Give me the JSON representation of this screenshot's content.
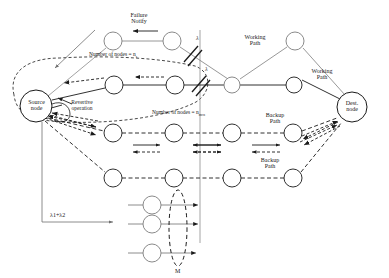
{
  "figure": {
    "type": "network-protection-diagram",
    "title": "",
    "stroke_color": "#2b2b2b",
    "light_stroke_color": "#8a8a8a",
    "background": "#ffffff"
  },
  "labels": {
    "failure_notify_line1": "Failure",
    "failure_notify_line2": "Notify",
    "number_of_nodes_working": "Number of nodes  = n",
    "number_of_nodes_working_sub": "s",
    "number_of_nodes_backup": "Number of nodes =",
    "number_of_nodes_backup_var": "n",
    "number_of_nodes_backup_sub": "mcn",
    "working_path_top_line1": "Working",
    "working_path_top_line2": "Path",
    "working_path_right_line1": "Working",
    "working_path_right_line2": "Path",
    "backup_path_mid_line1": "Backup",
    "backup_path_mid_line2": "Path",
    "backup_path_low_line1": "Backup",
    "backup_path_low_line2": "Path",
    "source_node_line1": "Source",
    "source_node_line2": "node",
    "dest_node_line1": "Dest.",
    "dest_node_line2": "node",
    "revertive_line1": "Revertive",
    "revertive_line2": "operation",
    "lambda_upper": "λ",
    "lambda_lower": "λ",
    "lambda_sum": "λ1+λ2",
    "multiplicity": "M"
  },
  "nodes": [
    {
      "name": "source-node",
      "cx": 36,
      "cy": 106,
      "r": 16,
      "label": "Source node"
    },
    {
      "name": "dest-node",
      "cx": 352,
      "cy": 107,
      "r": 15,
      "label": "Dest. node"
    },
    {
      "name": "notify-node-left",
      "cx": 113,
      "cy": 41,
      "r": 9,
      "label": ""
    },
    {
      "name": "notify-node-right",
      "cx": 172,
      "cy": 41,
      "r": 9,
      "label": ""
    },
    {
      "name": "working-node-1",
      "cx": 114,
      "cy": 85,
      "r": 9,
      "label": ""
    },
    {
      "name": "working-node-2",
      "cx": 175,
      "cy": 85,
      "r": 9,
      "label": ""
    },
    {
      "name": "junction-node",
      "cx": 232,
      "cy": 85,
      "r": 8,
      "label": ""
    },
    {
      "name": "working-node-3",
      "cx": 294,
      "cy": 85,
      "r": 8,
      "label": ""
    },
    {
      "name": "apex-node",
      "cx": 295,
      "cy": 41,
      "r": 9,
      "label": ""
    },
    {
      "name": "backup-mid-node-1",
      "cx": 113,
      "cy": 133,
      "r": 9,
      "label": ""
    },
    {
      "name": "backup-mid-node-2",
      "cx": 174,
      "cy": 133,
      "r": 9,
      "label": ""
    },
    {
      "name": "backup-mid-node-3",
      "cx": 232,
      "cy": 133,
      "r": 9,
      "label": ""
    },
    {
      "name": "backup-mid-node-4",
      "cx": 293,
      "cy": 133,
      "r": 9,
      "label": ""
    },
    {
      "name": "backup-low-node-1",
      "cx": 113,
      "cy": 178,
      "r": 9,
      "label": ""
    },
    {
      "name": "backup-low-node-2",
      "cx": 174,
      "cy": 178,
      "r": 9,
      "label": ""
    },
    {
      "name": "backup-low-node-3",
      "cx": 232,
      "cy": 178,
      "r": 9,
      "label": ""
    },
    {
      "name": "backup-low-node-4",
      "cx": 293,
      "cy": 178,
      "r": 9,
      "label": ""
    },
    {
      "name": "multiplicity-node-1",
      "cx": 152,
      "cy": 205,
      "r": 9,
      "label": ""
    },
    {
      "name": "multiplicity-node-2",
      "cx": 152,
      "cy": 224,
      "r": 9,
      "label": ""
    },
    {
      "name": "multiplicity-node-3",
      "cx": 152,
      "cy": 253,
      "r": 9,
      "label": ""
    }
  ],
  "markers": {
    "failure_cut_upper": {
      "name": "failure-cut-upper",
      "x": 191,
      "y": 53
    },
    "failure_cut_lower": {
      "name": "failure-cut-lower",
      "x": 199,
      "y": 83
    },
    "multiplicity_ellipse": {
      "name": "multiplicity-ellipse",
      "cx": 178,
      "cy": 228,
      "rx": 9,
      "ry": 38
    }
  }
}
